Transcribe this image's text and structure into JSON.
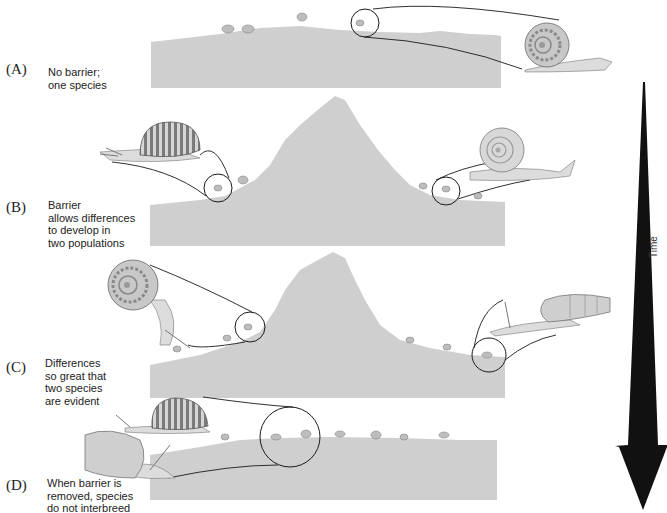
{
  "figure": {
    "type": "allopatric-speciation-diagram",
    "colors": {
      "ground": "#cfcfcf",
      "outline": "#1a1a1a",
      "arrow": "#111111",
      "snail_shell": "#bdbdbd",
      "snail_body": "#dcdcdc",
      "background": "#ffffff"
    }
  },
  "panels": [
    {
      "letter": "(A)",
      "description": "No barrier;\none species"
    },
    {
      "letter": "(B)",
      "description": "Barrier\nallows differences\nto develop in\ntwo populations"
    },
    {
      "letter": "(C)",
      "description": "Differences\nso great that\ntwo species\nare evident"
    },
    {
      "letter": "(D)",
      "description": "When barrier is\nremoved, species\ndo not interbreed"
    }
  ],
  "time_axis": {
    "label": "Time",
    "direction": "down"
  }
}
